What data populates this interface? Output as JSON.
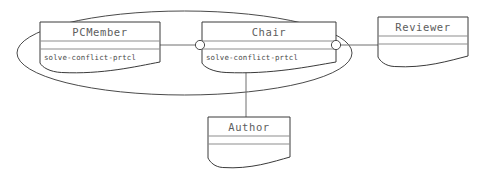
{
  "diagram": {
    "background_color": "#ffffff",
    "stroke_color": "#3a3a3a",
    "text_color": "#5d5d5d",
    "classes": [
      {
        "id": "pcmember",
        "name": "PCMember",
        "members": [
          "solve-conflict-prtcl"
        ],
        "x": 40,
        "y": 22,
        "width": 120,
        "height": 46,
        "header_height": 19,
        "divider2_offset": 27
      },
      {
        "id": "chair",
        "name": "Chair",
        "members": [
          "solve-conflict-prtcl"
        ],
        "x": 202,
        "y": 22,
        "width": 134,
        "height": 46,
        "header_height": 19,
        "divider2_offset": 27
      },
      {
        "id": "reviewer",
        "name": "Reviewer",
        "members": [],
        "x": 378,
        "y": 17,
        "width": 90,
        "height": 45,
        "header_height": 19,
        "divider2_offset": 27
      },
      {
        "id": "author",
        "name": "Author",
        "members": [],
        "x": 208,
        "y": 117,
        "width": 82,
        "height": 46,
        "header_height": 19,
        "divider2_offset": 27
      }
    ],
    "group": {
      "label": "role-grouping-ellipse",
      "cx": 184.5,
      "cy": 53,
      "rx": 167.5,
      "ry": 42
    },
    "sockets": [
      {
        "id": "chair-left-socket",
        "cx": 200,
        "cy": 45,
        "r": 4.6
      },
      {
        "id": "chair-right-socket",
        "cx": 336,
        "cy": 45,
        "r": 4.6
      }
    ],
    "connections": [
      {
        "id": "pcmember-to-chair",
        "from": "pcmember",
        "to": "chair",
        "x1": 160,
        "y1": 45,
        "x2": 196,
        "y2": 45
      },
      {
        "id": "chair-to-reviewer",
        "from": "chair",
        "to": "reviewer",
        "x1": 341,
        "y1": 45,
        "x2": 378,
        "y2": 45
      },
      {
        "id": "chair-to-author",
        "from": "chair",
        "to": "author",
        "x1": 246,
        "y1": 68,
        "x2": 246,
        "y2": 117
      }
    ]
  }
}
